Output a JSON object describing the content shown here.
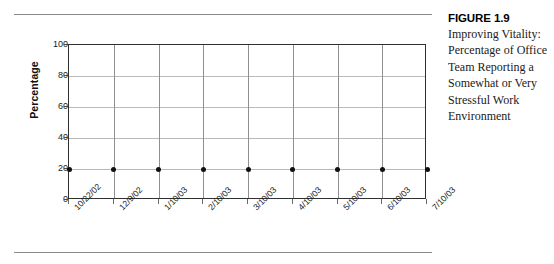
{
  "caption": {
    "heading": "FIGURE 1.9",
    "body": "Improving Vitality: Percentage of Office Team Reporting a Somewhat or Very Stressful Work Environment"
  },
  "colors": {
    "plot_border": "#303030",
    "horizontal_gridline": "#b9b9b9",
    "vertical_gridline": "#8f8f8f",
    "data_point": "#101010",
    "rule": "#8a8a8a",
    "text": "#1a1a1a",
    "background": "#ffffff"
  },
  "chart_data": {
    "type": "line",
    "title": "",
    "xlabel": "",
    "ylabel": "Percentage",
    "categories": [
      "10/22/02",
      "12/9/02",
      "1/10/03",
      "2/10/03",
      "3/10/03",
      "4/10/03",
      "5/10/03",
      "6/10/03",
      "7/10/03"
    ],
    "values": [
      20,
      20,
      20,
      20,
      20,
      20,
      20,
      20,
      20
    ],
    "series": [
      {
        "name": "Percentage Reporting Somewhat or Very Stressful Work Environment",
        "values": [
          20,
          20,
          20,
          20,
          20,
          20,
          20,
          20,
          20
        ]
      }
    ],
    "ylim": [
      0,
      100
    ],
    "yticks": [
      0,
      20,
      40,
      60,
      80,
      100
    ],
    "ytick_labels": [
      "0",
      "20",
      "40",
      "60",
      "80",
      "100"
    ],
    "grid": true,
    "grid_axes": "both",
    "legend": false,
    "legend_position": "none",
    "markers": "filled-circle",
    "line_visible": false
  }
}
